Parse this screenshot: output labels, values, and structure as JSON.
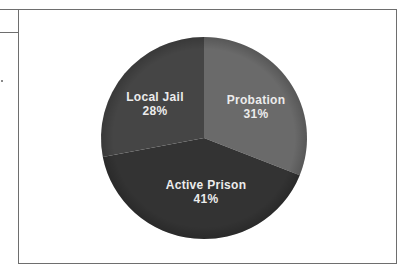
{
  "chart_data": {
    "type": "pie",
    "title": "",
    "start_angle_deg": 0,
    "direction": "clockwise",
    "legend": "none (labels inside slices)",
    "slices": [
      {
        "label": "Probation",
        "value": 31,
        "display": "31%",
        "color": "#6a6a6a"
      },
      {
        "label": "Active Prison",
        "value": 41,
        "display": "41%",
        "color": "#333333"
      },
      {
        "label": "Local Jail",
        "value": 28,
        "display": "28%",
        "color": "#454545"
      }
    ],
    "label_color": "#ececec"
  },
  "labels": {
    "probation": {
      "name": "Probation",
      "pct": "31%"
    },
    "active_prison": {
      "name": "Active Prison",
      "pct": "41%"
    },
    "local_jail": {
      "name": "Local Jail",
      "pct": "28%"
    }
  }
}
